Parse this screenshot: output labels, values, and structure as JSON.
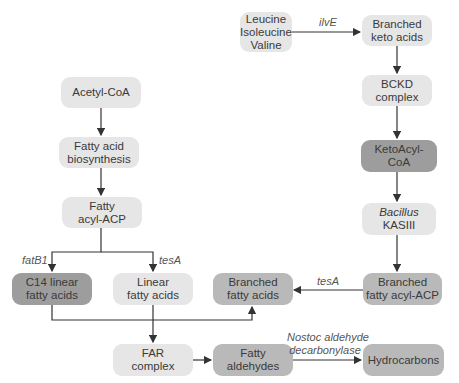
{
  "diagram": {
    "nodes": {
      "leucine": {
        "line1": "Leucine",
        "line2": "Isoleucine",
        "line3": "Valine"
      },
      "branched_keto": {
        "line1": "Branched",
        "line2": "keto acids"
      },
      "bckd": {
        "line1": "BCKD",
        "line2": "complex"
      },
      "ketoacyl": {
        "line1": "KetoAcyl-CoA"
      },
      "kasiii": {
        "line1": "Bacillus",
        "line2": "KASIII"
      },
      "branched_acyl_acp": {
        "line1": "Branched",
        "line2": "fatty acyl-ACP"
      },
      "acetyl": {
        "line1": "Acetyl-CoA"
      },
      "fa_biosynthesis": {
        "line1": "Fatty acid",
        "line2": "biosynthesis"
      },
      "fatty_acyl_acp": {
        "line1": "Fatty",
        "line2": "acyl-ACP"
      },
      "c14": {
        "line1": "C14 linear",
        "line2": "fatty acids"
      },
      "linear": {
        "line1": "Linear",
        "line2": "fatty acids"
      },
      "branched_fa": {
        "line1": "Branched",
        "line2": "fatty acids"
      },
      "far": {
        "line1": "FAR",
        "line2": "complex"
      },
      "aldehydes": {
        "line1": "Fatty",
        "line2": "aldehydes"
      },
      "hydrocarbons": {
        "line1": "Hydrocarbons"
      }
    },
    "edge_labels": {
      "ilve": "ilvE",
      "fatb1": "fatB1",
      "tesa_left": "tesA",
      "tesa_right": "tesA",
      "nostoc_line1": "Nostoc aldehyde",
      "nostoc_line2": "decarbonylase"
    },
    "colors": {
      "light_box": "#e6e6e6",
      "mid_box": "#b9b9b9",
      "dark_box": "#9d9d9d",
      "arrow": "#333333"
    }
  }
}
